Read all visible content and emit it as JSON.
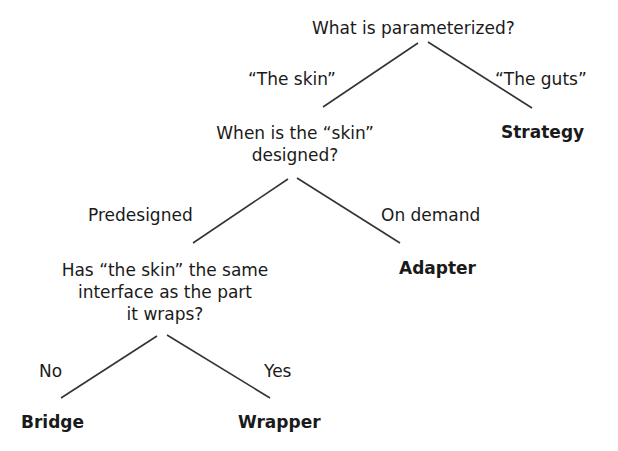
{
  "diagram": {
    "root": {
      "question": "What is parameterized?",
      "left_edge": "“The skin”",
      "right_edge": "“The guts”",
      "right_leaf": "Strategy"
    },
    "level2": {
      "question_line1": "When is the “skin”",
      "question_line2": "designed?",
      "left_edge": "Predesigned",
      "right_edge": "On demand",
      "right_leaf": "Adapter"
    },
    "level3": {
      "question_line1": "Has “the skin” the same",
      "question_line2": "interface as the part",
      "question_line3": "it wraps?",
      "left_edge": "No",
      "right_edge": "Yes",
      "left_leaf": "Bridge",
      "right_leaf": "Wrapper"
    },
    "line_color": "#333333"
  }
}
